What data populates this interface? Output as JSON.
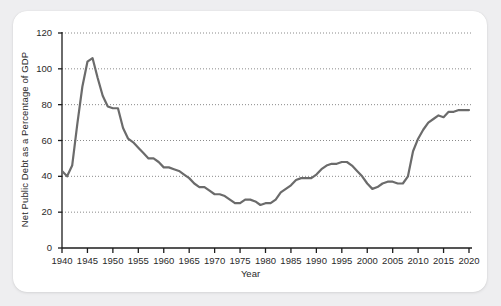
{
  "chart_data": {
    "type": "line",
    "title": "",
    "xlabel": "Year",
    "ylabel": "Net Public Debt as a Percentage of GDP",
    "xlim": [
      1940,
      2020
    ],
    "ylim": [
      0,
      120
    ],
    "grid": true,
    "legend": "none",
    "line_color": "#6b6b6b",
    "xticks": [
      1940,
      1945,
      1950,
      1955,
      1960,
      1965,
      1970,
      1975,
      1980,
      1985,
      1990,
      1995,
      2000,
      2005,
      2010,
      2015,
      2020
    ],
    "yticks": [
      0,
      20,
      40,
      60,
      80,
      100,
      120
    ],
    "series": [
      {
        "name": "Net Public Debt as a Percentage of GDP",
        "x": [
          1940,
          1941,
          1942,
          1943,
          1944,
          1945,
          1946,
          1947,
          1948,
          1949,
          1950,
          1951,
          1952,
          1953,
          1954,
          1955,
          1956,
          1957,
          1958,
          1959,
          1960,
          1961,
          1962,
          1963,
          1964,
          1965,
          1966,
          1967,
          1968,
          1969,
          1970,
          1971,
          1972,
          1973,
          1974,
          1975,
          1976,
          1977,
          1978,
          1979,
          1980,
          1981,
          1982,
          1983,
          1984,
          1985,
          1986,
          1987,
          1988,
          1989,
          1990,
          1991,
          1992,
          1993,
          1994,
          1995,
          1996,
          1997,
          1998,
          1999,
          2000,
          2001,
          2002,
          2003,
          2004,
          2005,
          2006,
          2007,
          2008,
          2009,
          2010,
          2011,
          2012,
          2013,
          2014,
          2015,
          2016,
          2017,
          2018,
          2019,
          2020
        ],
        "values": [
          43,
          40,
          46,
          69,
          90,
          104,
          106,
          95,
          85,
          79,
          78,
          78,
          67,
          61,
          59,
          56,
          53,
          50,
          50,
          48,
          45,
          45,
          44,
          43,
          41,
          39,
          36,
          34,
          34,
          32,
          30,
          30,
          29,
          27,
          25,
          25,
          27,
          27,
          26,
          24,
          25,
          25,
          27,
          31,
          33,
          35,
          38,
          39,
          39,
          39,
          41,
          44,
          46,
          47,
          47,
          48,
          48,
          46,
          43,
          40,
          36,
          33,
          34,
          36,
          37,
          37,
          36,
          36,
          40,
          54,
          61,
          66,
          70,
          72,
          74,
          73,
          76,
          76,
          77,
          77,
          77
        ]
      }
    ],
    "annotations": {
      "peak_year": 1946,
      "peak_value": 106,
      "trough_year": 1974,
      "trough_value": 25
    }
  }
}
